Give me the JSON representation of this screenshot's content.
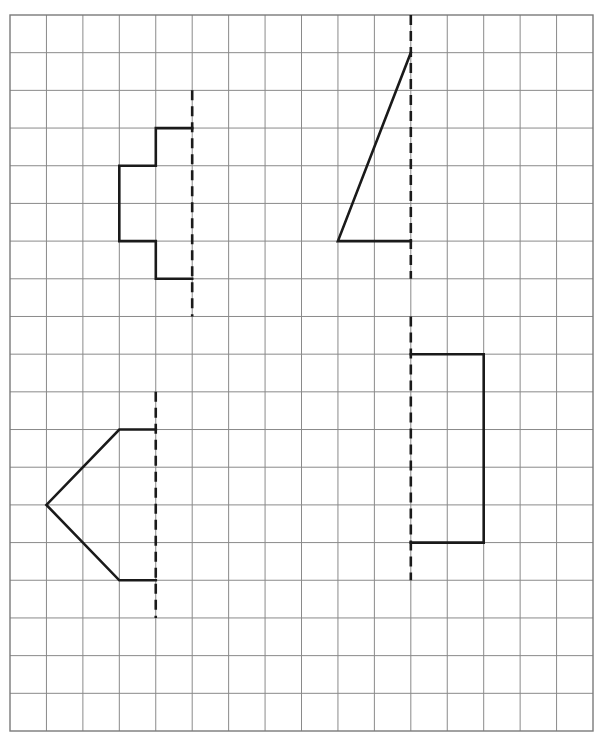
{
  "worksheet": {
    "title": "Symmetry grid: complete each shape across its dashed line of symmetry",
    "grid": {
      "columns": 16,
      "rows": 19,
      "left": 10,
      "top": 15,
      "right": 593,
      "bottom": 731,
      "line_color": "#8a8a8a"
    },
    "stroke_color": "#1a1a1a",
    "figures": [
      {
        "name": "stepped-shape",
        "axis": {
          "col": 5,
          "row_start": 2,
          "row_end": 8
        },
        "points": [
          [
            5,
            3
          ],
          [
            4,
            3
          ],
          [
            4,
            4
          ],
          [
            3,
            4
          ],
          [
            3,
            6
          ],
          [
            4,
            6
          ],
          [
            4,
            7
          ],
          [
            5,
            7
          ]
        ]
      },
      {
        "name": "right-triangle",
        "axis": {
          "col": 11,
          "row_start": 0,
          "row_end": 7
        },
        "points": [
          [
            11,
            1
          ],
          [
            9,
            6
          ],
          [
            11,
            6
          ]
        ]
      },
      {
        "name": "arrow-shape",
        "axis": {
          "col": 4,
          "row_start": 10,
          "row_end": 16
        },
        "points": [
          [
            4,
            11
          ],
          [
            3,
            11
          ],
          [
            1,
            13
          ],
          [
            3,
            15
          ],
          [
            4,
            15
          ]
        ]
      },
      {
        "name": "rectangle-shape",
        "axis": {
          "col": 11,
          "row_start": 8,
          "row_end": 15
        },
        "points": [
          [
            11,
            9
          ],
          [
            13,
            9
          ],
          [
            13,
            14
          ],
          [
            11,
            14
          ]
        ]
      }
    ]
  }
}
